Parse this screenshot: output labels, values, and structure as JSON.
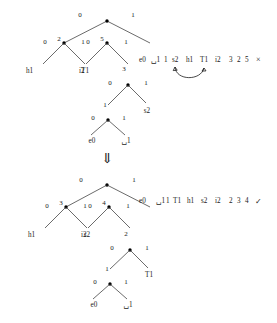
{
  "figure": {
    "background_color": "#ffffff",
    "ink_color": "#1a1a1a"
  },
  "tree_top": {
    "name": "huffman-tree-before",
    "root": {
      "label": "",
      "x": 107,
      "y": 21
    },
    "edge_labels": {
      "root_left": "0",
      "root_right": "1",
      "n2_left": "0",
      "n2_right": "1",
      "n5_left": "0",
      "n5_right": "1",
      "n3_left": "0",
      "n3_right": "1",
      "n1_left": "0",
      "n1_right": "1"
    },
    "node_labels": {
      "n2": "2",
      "n5": "5",
      "n3": "3",
      "n1": "1"
    },
    "leaf_labels": {
      "h1": "h1",
      "T1": "T1",
      "i2": "i2",
      "s2": "s2",
      "e0": "e0",
      "sp1": "␣1"
    }
  },
  "tree_bottom": {
    "name": "huffman-tree-after",
    "edge_labels": {
      "root_left": "0",
      "root_right": "1",
      "n3_left": "0",
      "n3_right": "1",
      "n4_left": "0",
      "n4_right": "1",
      "n2_left": "0",
      "n2_right": "1",
      "n1_left": "0",
      "n1_right": "1"
    },
    "node_labels": {
      "n3": "3",
      "n4": "4",
      "n2": "2",
      "n1": "1"
    },
    "leaf_labels": {
      "h1": "h1",
      "s2": "s2",
      "i2": "i2",
      "T1": "T1",
      "e0": "e0",
      "sp1": "␣1"
    }
  },
  "sequence_top": {
    "name": "node-sequence-before",
    "tokens": [
      "e0",
      "␣1",
      "1",
      "s2",
      "h1",
      "T1",
      "i2",
      "3",
      "2",
      "5"
    ],
    "mark": "×",
    "mark_meaning": "invalid-sibling-order",
    "swap_from_token_index": 3,
    "swap_to_token_index": 5
  },
  "sequence_bottom": {
    "name": "node-sequence-after",
    "tokens": [
      "e0",
      "␣1",
      "1",
      "T1",
      "h1",
      "s2",
      "i2",
      "2",
      "3",
      "4"
    ],
    "mark": "✓",
    "mark_meaning": "valid-sibling-order"
  },
  "transition": {
    "name": "downward-transition-arrow",
    "glyph": "⇓"
  }
}
